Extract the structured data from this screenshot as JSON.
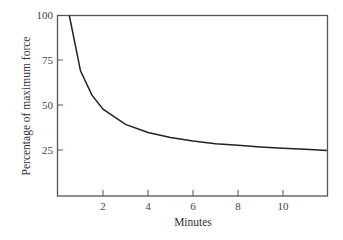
{
  "chart_data": {
    "type": "line",
    "title": "",
    "xlabel": "Minutes",
    "ylabel": "Percentage of maximum force",
    "xlim": [
      0,
      12
    ],
    "ylim": [
      0,
      100
    ],
    "x_ticks": [
      2,
      4,
      6,
      8,
      10
    ],
    "y_ticks": [
      25,
      50,
      75,
      100
    ],
    "grid": false,
    "legend": null,
    "series": [
      {
        "name": "force",
        "x": [
          0.5,
          1,
          1.5,
          2,
          3,
          4,
          5,
          6,
          7,
          8,
          9,
          10,
          11,
          11.95
        ],
        "y": [
          100,
          69.3,
          55.9,
          48,
          39.5,
          35,
          32.2,
          30.2,
          28.8,
          27.9,
          27,
          26.3,
          25.7,
          25
        ]
      }
    ],
    "annotations": []
  },
  "labels": {
    "xlabel": "Minutes",
    "ylabel": "Percentage of maximum force",
    "x_ticks": [
      "2",
      "4",
      "6",
      "8",
      "10"
    ],
    "y_ticks": [
      "100",
      "75",
      "50",
      "25"
    ]
  }
}
